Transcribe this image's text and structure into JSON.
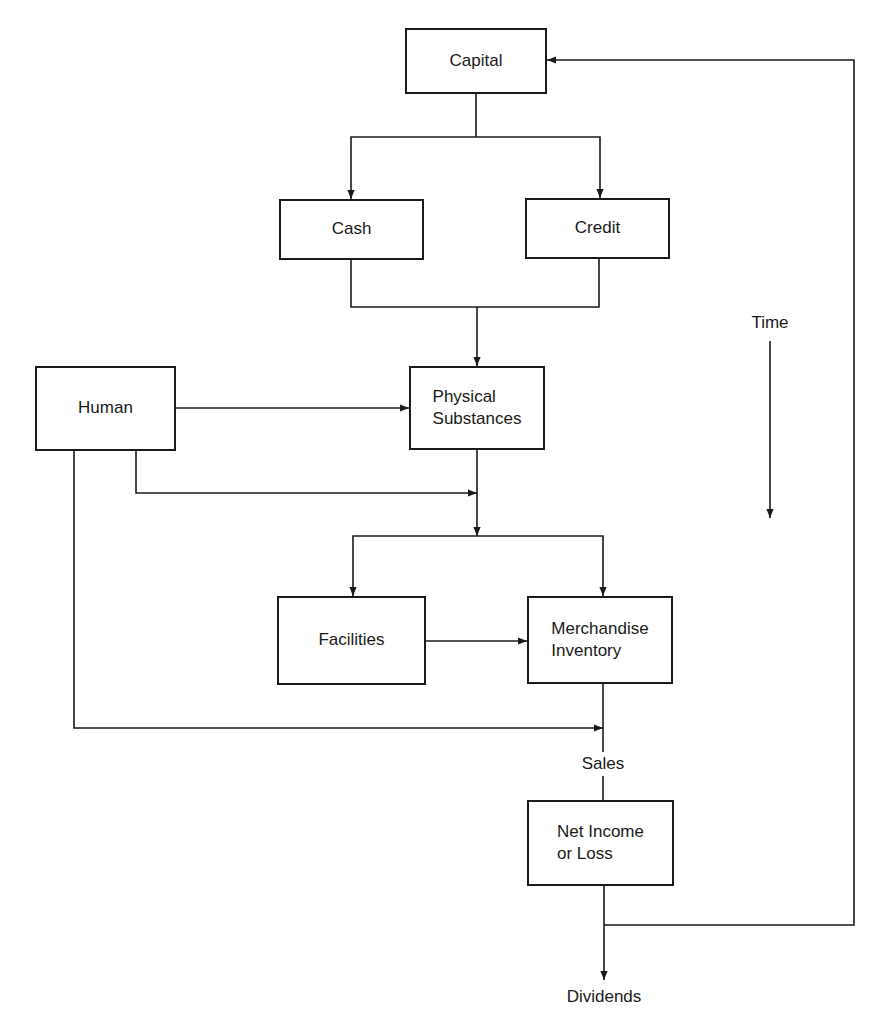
{
  "diagram": {
    "nodes": {
      "capital": "Capital",
      "cash": "Cash",
      "credit": "Credit",
      "human": "Human",
      "physical": [
        "Physical",
        "Substances"
      ],
      "facilities": "Facilities",
      "merchandise": [
        "Merchandise",
        "Inventory"
      ],
      "net_income": [
        "Net Income",
        "or Loss"
      ]
    },
    "labels": {
      "time": "Time",
      "sales": "Sales",
      "dividends": "Dividends"
    },
    "edges": [
      {
        "from": "Capital",
        "to": "Cash"
      },
      {
        "from": "Capital",
        "to": "Credit"
      },
      {
        "from": "Cash",
        "to": "Physical Substances"
      },
      {
        "from": "Credit",
        "to": "Physical Substances"
      },
      {
        "from": "Human",
        "to": "Physical Substances"
      },
      {
        "from": "Human",
        "to": "Physical Substances output"
      },
      {
        "from": "Physical Substances",
        "to": "Facilities"
      },
      {
        "from": "Physical Substances",
        "to": "Merchandise Inventory"
      },
      {
        "from": "Facilities",
        "to": "Merchandise Inventory"
      },
      {
        "from": "Human",
        "to": "Sales"
      },
      {
        "from": "Merchandise Inventory",
        "to": "Net Income or Loss",
        "via": "Sales"
      },
      {
        "from": "Net Income or Loss",
        "to": "Dividends"
      },
      {
        "from": "Net Income or Loss",
        "to": "Capital"
      }
    ]
  }
}
